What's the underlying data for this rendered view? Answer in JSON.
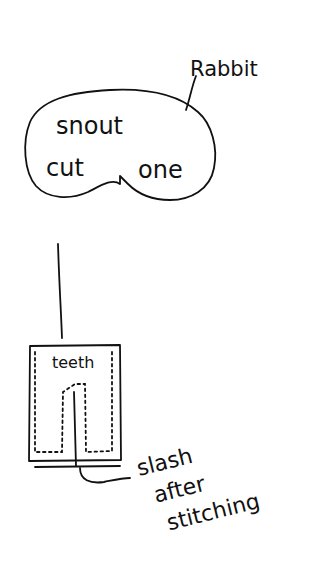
{
  "diagram": {
    "type": "sewing-pattern-sketch",
    "pieces": {
      "snout": {
        "label_line1": "snout",
        "label_line2a": "cut",
        "label_line2b": "one",
        "callout": "Rabbit"
      },
      "teeth": {
        "label": "teeth",
        "callout_line1": "slash",
        "callout_line2": "after",
        "callout_line3": "stitching"
      }
    },
    "ink_color": "#111111",
    "background": "#ffffff"
  }
}
